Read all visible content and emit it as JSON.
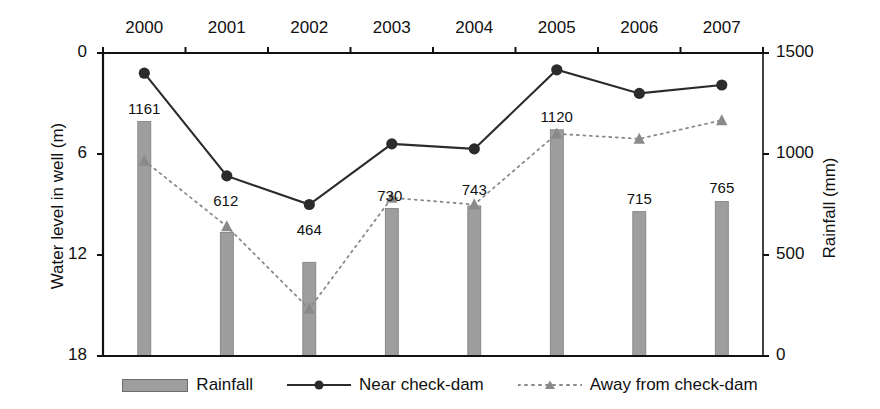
{
  "chart_data": {
    "type": "bar",
    "title": "",
    "subtitle": "",
    "categories": [
      "2000",
      "2001",
      "2002",
      "2003",
      "2004",
      "2005",
      "2006",
      "2007"
    ],
    "xlabel": "",
    "ylabel_left": "Water level in well (m)",
    "ylabel_right": "Rainfall (mm)",
    "ylim_left": [
      18,
      0
    ],
    "ylim_right": [
      0,
      1500
    ],
    "yticks_left": [
      "0",
      "6",
      "12",
      "18"
    ],
    "yticks_left_values": [
      0,
      6,
      12,
      18
    ],
    "yticks_right": [
      "0",
      "500",
      "1000",
      "1500"
    ],
    "yticks_right_values": [
      0,
      500,
      1000,
      1500
    ],
    "grid": false,
    "legend_position": "bottom",
    "xaxis_position": "top",
    "series": [
      {
        "name": "Rainfall",
        "type": "bar",
        "axis": "right",
        "unit": "mm",
        "color": "#9e9e9e",
        "values": [
          1161,
          612,
          464,
          730,
          743,
          1120,
          715,
          765
        ],
        "data_labels": [
          "1161",
          "612",
          "464",
          "730",
          "743",
          "1120",
          "715",
          "765"
        ]
      },
      {
        "name": "Near check-dam",
        "type": "line",
        "axis": "left",
        "unit": "m",
        "color": "#2b2b2b",
        "line_style": "solid",
        "marker": "circle",
        "values": [
          1.2,
          7.3,
          9.0,
          5.4,
          5.7,
          1.0,
          2.4,
          1.9
        ]
      },
      {
        "name": "Away from check-dam",
        "type": "line",
        "axis": "left",
        "unit": "m",
        "color": "#8a8a8a",
        "line_style": "dotted",
        "marker": "triangle",
        "values": [
          6.4,
          10.3,
          15.2,
          8.6,
          9.0,
          4.8,
          5.1,
          4.0
        ]
      }
    ]
  },
  "legend": {
    "items": [
      {
        "label": "Rainfall",
        "marker": "bar-swatch"
      },
      {
        "label": "Near check-dam",
        "marker": "line-circle"
      },
      {
        "label": "Away from check-dam",
        "marker": "dotted-triangle"
      }
    ]
  }
}
